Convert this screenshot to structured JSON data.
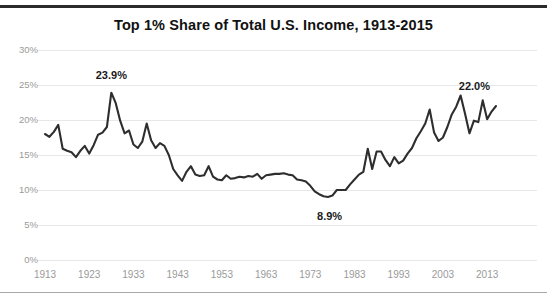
{
  "chart_data": {
    "type": "line",
    "title": "Top 1% Share of Total U.S. Income, 1913-2015",
    "xlabel": "",
    "ylabel": "",
    "xlim": [
      1913,
      2015
    ],
    "ylim": [
      0,
      30
    ],
    "grid": true,
    "legend": null,
    "y_tick_labels": [
      "30%",
      "25%",
      "20%",
      "15%",
      "10%",
      "5%",
      "0%"
    ],
    "y_ticks": [
      30,
      25,
      20,
      15,
      10,
      5,
      0
    ],
    "x_tick_labels": [
      "1913",
      "1923",
      "1933",
      "1943",
      "1953",
      "1963",
      "1973",
      "1983",
      "1993",
      "2003",
      "2013"
    ],
    "x_ticks": [
      1913,
      1923,
      1933,
      1943,
      1953,
      1963,
      1973,
      1983,
      1993,
      2003,
      2013
    ],
    "series_name": "Top 1% income share",
    "line_color": "#2e2e2e",
    "annotations": [
      {
        "label": "23.9%",
        "x": 1928,
        "y": 23.9
      },
      {
        "label": "8.9%",
        "x": 1976,
        "y": 8.9
      },
      {
        "label": "22.0%",
        "x": 2015,
        "y": 22.0
      }
    ],
    "x": [
      1913,
      1914,
      1915,
      1916,
      1917,
      1918,
      1919,
      1920,
      1921,
      1922,
      1923,
      1924,
      1925,
      1926,
      1927,
      1928,
      1929,
      1930,
      1931,
      1932,
      1933,
      1934,
      1935,
      1936,
      1937,
      1938,
      1939,
      1940,
      1941,
      1942,
      1943,
      1944,
      1945,
      1946,
      1947,
      1948,
      1949,
      1950,
      1951,
      1952,
      1953,
      1954,
      1955,
      1956,
      1957,
      1958,
      1959,
      1960,
      1961,
      1962,
      1963,
      1964,
      1965,
      1966,
      1967,
      1968,
      1969,
      1970,
      1971,
      1972,
      1973,
      1974,
      1975,
      1976,
      1977,
      1978,
      1979,
      1980,
      1981,
      1982,
      1983,
      1984,
      1985,
      1986,
      1987,
      1988,
      1989,
      1990,
      1991,
      1992,
      1993,
      1994,
      1995,
      1996,
      1997,
      1998,
      1999,
      2000,
      2001,
      2002,
      2003,
      2004,
      2005,
      2006,
      2007,
      2008,
      2009,
      2010,
      2011,
      2012,
      2013,
      2014,
      2015
    ],
    "values": [
      18.0,
      17.6,
      18.3,
      19.3,
      15.9,
      15.6,
      15.4,
      14.7,
      15.6,
      16.3,
      15.2,
      16.4,
      17.9,
      18.2,
      19.0,
      23.9,
      22.4,
      19.9,
      18.1,
      18.5,
      16.5,
      16.0,
      16.9,
      19.5,
      17.1,
      16.0,
      16.7,
      16.3,
      15.0,
      13.0,
      12.1,
      11.3,
      12.6,
      13.4,
      12.2,
      12.0,
      12.1,
      13.4,
      11.9,
      11.5,
      11.4,
      12.1,
      11.6,
      11.7,
      11.9,
      11.8,
      12.0,
      11.9,
      12.3,
      11.6,
      12.1,
      12.2,
      12.3,
      12.3,
      12.4,
      12.2,
      12.1,
      11.5,
      11.4,
      11.2,
      10.6,
      9.8,
      9.4,
      9.1,
      9.0,
      9.2,
      10.0,
      10.0,
      10.0,
      10.8,
      11.5,
      12.2,
      12.6,
      15.9,
      13.0,
      15.5,
      15.5,
      14.3,
      13.4,
      14.7,
      13.8,
      14.2,
      15.2,
      16.0,
      17.4,
      18.4,
      19.5,
      21.5,
      18.2,
      17.0,
      17.5,
      19.0,
      20.8,
      21.9,
      23.5,
      20.9,
      18.1,
      19.9,
      19.7,
      22.8,
      20.1,
      21.2,
      22.0
    ]
  }
}
